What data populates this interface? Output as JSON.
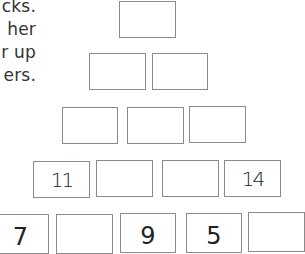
{
  "instructions": {
    "lines": [
      "cks.",
      "her",
      "r  up",
      "ers."
    ]
  },
  "pyramid": {
    "row1": [
      ""
    ],
    "row2": [
      "",
      ""
    ],
    "row3": [
      "",
      "",
      ""
    ],
    "row4": [
      "11",
      "",
      "",
      "14"
    ],
    "row5": [
      "7",
      "",
      "9",
      "5",
      ""
    ]
  }
}
